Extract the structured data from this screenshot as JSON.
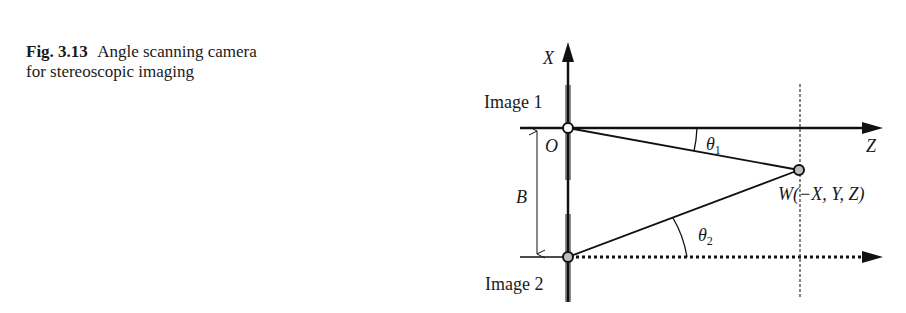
{
  "caption": {
    "figure_label": "Fig. 3.13",
    "text": "Angle scanning camera for stereoscopic imaging"
  },
  "diagram": {
    "axis_x_label": "X",
    "axis_z_label": "Z",
    "origin_label": "O",
    "baseline_label": "B",
    "image1_label": "Image 1",
    "image2_label": "Image 2",
    "point_label": "W(−X, Y, Z)",
    "theta1_symbol": "θ",
    "theta1_sub": "1",
    "theta2_symbol": "θ",
    "theta2_sub": "2",
    "colors": {
      "line": "#111111",
      "sensor_bar": "#8c8c8c",
      "point_fill": "#bdbdbd"
    }
  }
}
